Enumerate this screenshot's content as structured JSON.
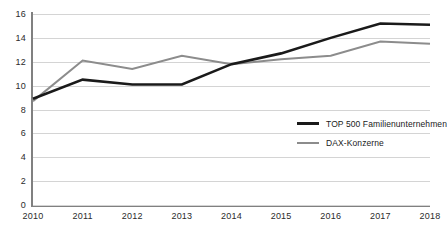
{
  "chart_data": {
    "type": "line",
    "title": "",
    "subtitle": "",
    "xlabel": "",
    "ylabel": "",
    "x": [
      2010,
      2011,
      2012,
      2013,
      2014,
      2015,
      2016,
      2017,
      2018
    ],
    "categories": [
      "2010",
      "2011",
      "2012",
      "2013",
      "2014",
      "2015",
      "2016",
      "2017",
      "2018"
    ],
    "series": [
      {
        "name": "TOP 500 Familienunternehmen",
        "color": "#1a1a1a",
        "width": 2.6,
        "values": [
          8.9,
          10.5,
          10.1,
          10.1,
          11.8,
          12.7,
          14.0,
          15.2,
          15.1
        ]
      },
      {
        "name": "DAX-Konzerne",
        "color": "#8c8c8c",
        "width": 2.0,
        "values": [
          8.7,
          12.1,
          11.4,
          12.5,
          11.8,
          12.2,
          12.5,
          13.7,
          13.5
        ]
      }
    ],
    "ylim": [
      0,
      16
    ],
    "yticks": [
      0,
      2,
      4,
      6,
      8,
      10,
      12,
      14,
      16
    ],
    "ytick_labels": [
      "0",
      "2",
      "4",
      "6",
      "8",
      "10",
      "12",
      "14",
      "16"
    ],
    "xtick_labels": [
      "2010",
      "2011",
      "2012",
      "2013",
      "2014",
      "2015",
      "2016",
      "2017",
      "2018"
    ],
    "grid": true,
    "grid_axis": "y",
    "grid_color": "#d4d4d4",
    "legend_position": "center-right",
    "axis_color": "#808080",
    "background": "#ffffff"
  },
  "legend": {
    "items": [
      {
        "label": "TOP 500 Familienunternehmen",
        "color": "#1a1a1a"
      },
      {
        "label": "DAX-Konzerne",
        "color": "#8c8c8c"
      }
    ]
  }
}
